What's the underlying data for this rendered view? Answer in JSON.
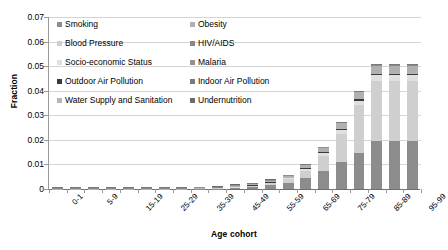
{
  "chart": {
    "type": "bar",
    "y_axis_title": "Fraction",
    "x_axis_title": "Age cohort"
  },
  "chart_data": {
    "type": "bar",
    "subtype": "stacked-bar",
    "title": "",
    "xlabel": "Age cohort",
    "ylabel": "Fraction",
    "ylim": [
      0,
      0.07
    ],
    "ytick_labels": [
      "0.07",
      "0.06",
      "0.05",
      "0.04",
      "0.03",
      "0.02",
      "0.01",
      "0"
    ],
    "ytick_values": [
      0.07,
      0.06,
      0.05,
      0.04,
      0.03,
      0.02,
      0.01,
      0
    ],
    "grid": "horizontal",
    "legend_position": "inside-top-left",
    "categories": [
      "0-1",
      "1-4",
      "5-9",
      "10-14",
      "15-19",
      "20-24",
      "25-29",
      "30-34",
      "35-39",
      "40-44",
      "45-49",
      "50-54",
      "55-59",
      "60-64",
      "65-69",
      "70-74",
      "75-79",
      "80-84",
      "85-89",
      "90-94",
      "95-99"
    ],
    "xtick_labels_shown": [
      "0-1",
      "5-9",
      "15-19",
      "25-29",
      "35-39",
      "45-49",
      "55-59",
      "65-69",
      "75-79",
      "85-89",
      "95-99"
    ],
    "series": [
      {
        "name": "Smoking",
        "color": "#8c8c8c",
        "values": [
          0,
          0,
          0,
          0,
          0,
          0,
          0,
          0,
          0.0001,
          0.0002,
          0.0004,
          0.0008,
          0.0016,
          0.0025,
          0.0045,
          0.0075,
          0.011,
          0.0145,
          0.0195,
          0.0195,
          0.0195
        ]
      },
      {
        "name": "Blood Pressure",
        "color": "#cfcfcf",
        "values": [
          0,
          0,
          0,
          0,
          0,
          0,
          0,
          0,
          0,
          0.0001,
          0.0002,
          0.0004,
          0.0007,
          0.0014,
          0.003,
          0.006,
          0.0115,
          0.0195,
          0.0245,
          0.0245,
          0.0245
        ]
      },
      {
        "name": "Socio-economic Status",
        "color": "#e0e0e0",
        "values": [
          0,
          0,
          0,
          0,
          0,
          0,
          0,
          0,
          0,
          0,
          0.0001,
          0.0002,
          0.0003,
          0.0005,
          0.0008,
          0.0012,
          0.0016,
          0.002,
          0.0023,
          0.0023,
          0.0023
        ]
      },
      {
        "name": "Outdoor Air Pollution",
        "color": "#3a3a3a",
        "values": [
          0,
          0,
          0,
          0,
          0,
          0,
          0,
          0,
          0,
          0,
          0.0001,
          0.0001,
          0.0002,
          0.0002,
          0.0003,
          0.0004,
          0.0005,
          0.0006,
          0.0007,
          0.0007,
          0.0007
        ]
      },
      {
        "name": "Water Supply and Sanitation",
        "color": "#b5b5b5",
        "values": [
          5e-05,
          5e-05,
          3e-05,
          3e-05,
          3e-05,
          3e-05,
          3e-05,
          3e-05,
          4e-05,
          4e-05,
          5e-05,
          5e-05,
          6e-05,
          6e-05,
          7e-05,
          8e-05,
          9e-05,
          0.0001,
          0.0001,
          0.0001,
          0.0001
        ]
      },
      {
        "name": "Obesity",
        "color": "#b0b0b0",
        "values": [
          0,
          0,
          0,
          0,
          0,
          0,
          0,
          0,
          0,
          0,
          0.0001,
          0.0002,
          0.0003,
          0.0005,
          0.0009,
          0.0014,
          0.002,
          0.0026,
          0.003,
          0.003,
          0.003
        ]
      },
      {
        "name": "HIV/AIDS",
        "color": "#888888",
        "values": [
          2e-05,
          2e-05,
          1e-05,
          1e-05,
          2e-05,
          3e-05,
          4e-05,
          5e-05,
          5e-05,
          5e-05,
          4e-05,
          3e-05,
          2e-05,
          2e-05,
          1e-05,
          1e-05,
          1e-05,
          1e-05,
          1e-05,
          1e-05,
          1e-05
        ]
      },
      {
        "name": "Malaria",
        "color": "#909090",
        "values": [
          3e-05,
          2e-05,
          1e-05,
          1e-05,
          1e-05,
          1e-05,
          1e-05,
          1e-05,
          1e-05,
          1e-05,
          1e-05,
          1e-05,
          1e-05,
          1e-05,
          1e-05,
          1e-05,
          1e-05,
          1e-05,
          1e-05,
          1e-05,
          1e-05
        ]
      },
      {
        "name": "Indoor Air Pollution",
        "color": "#7a7a7a",
        "values": [
          4e-05,
          3e-05,
          2e-05,
          2e-05,
          2e-05,
          2e-05,
          2e-05,
          3e-05,
          3e-05,
          4e-05,
          5e-05,
          6e-05,
          8e-05,
          0.0001,
          0.00012,
          0.00015,
          0.00018,
          0.0002,
          0.00022,
          0.00022,
          0.00022
        ]
      },
      {
        "name": "Undernutrition",
        "color": "#6b6b6b",
        "values": [
          6e-05,
          4e-05,
          2e-05,
          1e-05,
          1e-05,
          1e-05,
          1e-05,
          1e-05,
          1e-05,
          1e-05,
          1e-05,
          1e-05,
          1e-05,
          1e-05,
          1e-05,
          1e-05,
          1e-05,
          1e-05,
          1e-05,
          1e-05,
          1e-05
        ]
      }
    ],
    "totals": [
      0.0002,
      0.00016,
      9e-05,
      8e-05,
      9e-05,
      0.0001,
      0.00011,
      0.00013,
      0.00023,
      0.00045,
      0.0009,
      0.0018,
      0.0031,
      0.0053,
      0.0096,
      0.0168,
      0.027,
      0.0395,
      0.0505,
      0.0505,
      0.0505
    ]
  },
  "legend": {
    "rows": [
      [
        {
          "label": "Smoking",
          "color": "#8c8c8c"
        },
        {
          "label": "Obesity",
          "color": "#b0b0b0"
        }
      ],
      [
        {
          "label": "Blood Pressure",
          "color": "#cfcfcf"
        },
        {
          "label": "HIV/AIDS",
          "color": "#888888"
        }
      ],
      [
        {
          "label": "Socio-economic Status",
          "color": "#e0e0e0"
        },
        {
          "label": "Malaria",
          "color": "#909090"
        }
      ],
      [
        {
          "label": "Outdoor Air Pollution",
          "color": "#3a3a3a"
        },
        {
          "label": "Indoor Air Pollution",
          "color": "#7a7a7a"
        }
      ],
      [
        {
          "label": "Water Supply and Sanitation",
          "color": "#b5b5b5"
        },
        {
          "label": "Undernutrition",
          "color": "#6b6b6b"
        }
      ]
    ]
  }
}
